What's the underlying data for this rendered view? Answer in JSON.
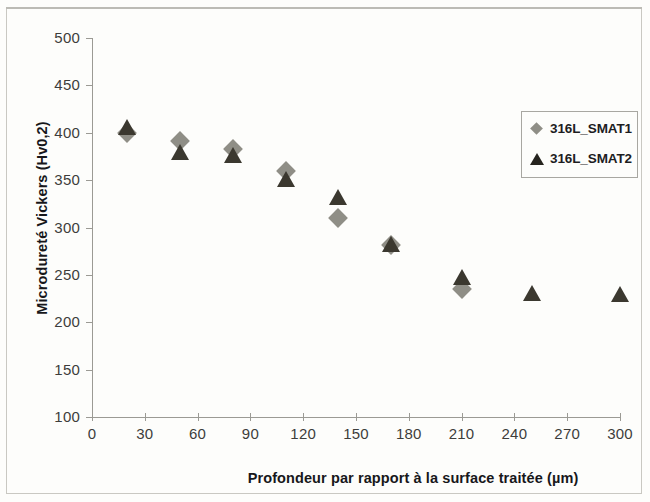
{
  "chart_data": {
    "type": "scatter",
    "title": "",
    "xlabel": "Profondeur par rapport à la surface traitée (µm)",
    "ylabel": "Microdureté Vickers (Hv0,2)",
    "xlim": [
      0,
      300
    ],
    "ylim": [
      100,
      500
    ],
    "xticks": [
      0,
      30,
      60,
      90,
      120,
      150,
      180,
      210,
      240,
      270,
      300
    ],
    "yticks": [
      100,
      150,
      200,
      250,
      300,
      350,
      400,
      450,
      500
    ],
    "grid": false,
    "legend_position": "upper right",
    "series": [
      {
        "name": "316L_SMAT1",
        "marker": "diamond",
        "color": "#8f8e86",
        "points": [
          {
            "x": 20,
            "y": 400
          },
          {
            "x": 50,
            "y": 391
          },
          {
            "x": 80,
            "y": 383
          },
          {
            "x": 110,
            "y": 360
          },
          {
            "x": 140,
            "y": 310
          },
          {
            "x": 170,
            "y": 282
          },
          {
            "x": 210,
            "y": 235
          }
        ]
      },
      {
        "name": "316L_SMAT2",
        "marker": "triangle",
        "color": "#3b382f",
        "points": [
          {
            "x": 20,
            "y": 406
          },
          {
            "x": 50,
            "y": 380
          },
          {
            "x": 80,
            "y": 377
          },
          {
            "x": 110,
            "y": 351
          },
          {
            "x": 140,
            "y": 332
          },
          {
            "x": 170,
            "y": 283
          },
          {
            "x": 210,
            "y": 248
          },
          {
            "x": 250,
            "y": 231
          },
          {
            "x": 300,
            "y": 230
          }
        ]
      }
    ]
  },
  "axes": {
    "x_title": "Profondeur par rapport à la surface traitée (µm)",
    "y_title": "Microdureté Vickers (Hv0,2)",
    "x_tick_labels": [
      "0",
      "30",
      "60",
      "90",
      "120",
      "150",
      "180",
      "210",
      "240",
      "270",
      "300"
    ],
    "y_tick_labels": [
      "500",
      "450",
      "400",
      "350",
      "300",
      "250",
      "200",
      "150",
      "100"
    ]
  },
  "legend": {
    "items": [
      {
        "label": "316L_SMAT1",
        "marker": "diamond-marker-icon"
      },
      {
        "label": "316L_SMAT2",
        "marker": "triangle-marker-icon"
      }
    ]
  }
}
